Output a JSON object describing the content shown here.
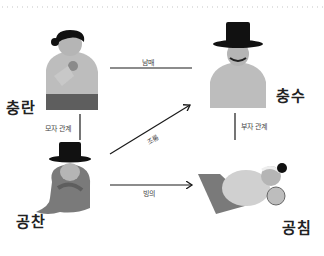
{
  "diagram": {
    "type": "character-relationship",
    "nodes": [
      {
        "id": "chungran",
        "label": "충란"
      },
      {
        "id": "chungsu",
        "label": "충수"
      },
      {
        "id": "gongchan",
        "label": "공찬"
      },
      {
        "id": "gongchim",
        "label": "공침"
      }
    ],
    "edges": [
      {
        "from": "chungran",
        "to": "chungsu",
        "label": "남매",
        "arrow": false
      },
      {
        "from": "chungran",
        "to": "gongchan",
        "label": "모자 관계",
        "arrow": false
      },
      {
        "from": "gongchan",
        "to": "chungsu",
        "label": "조롱",
        "arrow": true
      },
      {
        "from": "chungsu",
        "to": "gongchim",
        "label": "부자 관계",
        "arrow": false
      },
      {
        "from": "gongchan",
        "to": "gongchim",
        "label": "빙의",
        "arrow": true
      }
    ]
  },
  "colors": {
    "line": "#1a1a1a",
    "hat": "#111111",
    "skin": "#b5b5b5",
    "robe_light": "#bdbdbd",
    "robe_mid": "#8a8a8a",
    "robe_dark": "#5e5e5e"
  }
}
